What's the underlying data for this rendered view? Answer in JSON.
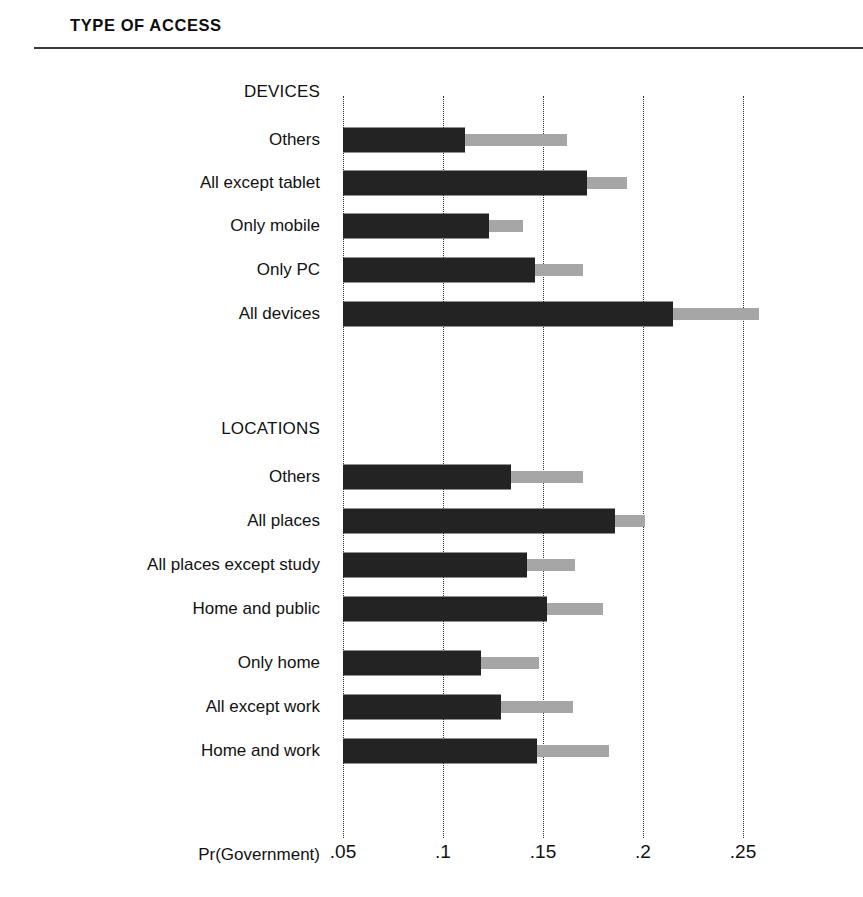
{
  "panel": {
    "title": "TYPE OF ACCESS"
  },
  "axis": {
    "title": "Pr(Government)",
    "ticks": [
      ".05",
      ".1",
      ".15",
      ".2",
      ".25"
    ],
    "tick_values": [
      0.05,
      0.1,
      0.15,
      0.2,
      0.25
    ]
  },
  "sections": [
    {
      "name": "devices-section",
      "label": "DEVICES"
    },
    {
      "name": "locations-section",
      "label": "LOCATIONS"
    }
  ],
  "colors": {
    "point_estimate": "#232323",
    "interval": "#a6a6a6",
    "gridline": "#2b2b2b",
    "rule": "#3a3a3a"
  },
  "chart_data": {
    "type": "bar",
    "title": "TYPE OF ACCESS",
    "xlabel": "Pr(Government)",
    "ylabel": "",
    "xlim": [
      0.05,
      0.27
    ],
    "grid": true,
    "orientation": "horizontal",
    "legend": [],
    "xticks": [
      0.05,
      0.1,
      0.15,
      0.2,
      0.25
    ],
    "xticklabels": [
      ".05",
      ".1",
      ".15",
      ".2",
      ".25"
    ],
    "groups": [
      {
        "label": "DEVICES",
        "categories": [
          "Others",
          "All except tablet",
          "Only mobile",
          "Only PC",
          "All devices"
        ],
        "values": [
          0.111,
          0.172,
          0.123,
          0.146,
          0.215
        ],
        "upper": [
          0.162,
          0.192,
          0.14,
          0.17,
          0.258
        ]
      },
      {
        "label": "LOCATIONS",
        "categories": [
          "Others",
          "All places",
          "All places except study",
          "Home and public",
          "Only home",
          "All except work",
          "Home and work"
        ],
        "values": [
          0.134,
          0.186,
          0.142,
          0.152,
          0.119,
          0.129,
          0.147
        ],
        "upper": [
          0.17,
          0.201,
          0.166,
          0.18,
          0.148,
          0.165,
          0.183
        ]
      }
    ],
    "series": [
      {
        "name": "point-estimate",
        "values": [
          0.111,
          0.172,
          0.123,
          0.146,
          0.215,
          0.134,
          0.186,
          0.142,
          0.152,
          0.119,
          0.129,
          0.147
        ]
      },
      {
        "name": "upper-bound",
        "values": [
          0.162,
          0.192,
          0.14,
          0.17,
          0.258,
          0.17,
          0.201,
          0.166,
          0.18,
          0.148,
          0.165,
          0.183
        ]
      }
    ]
  },
  "layout": {
    "x_origin_px": 343,
    "px_per_unit": 2000,
    "label_right_px": 320,
    "rows": [
      {
        "key": "devices-others",
        "y": 140,
        "group": 0,
        "index": 0
      },
      {
        "key": "devices-all-except-tablet",
        "y": 183,
        "group": 0,
        "index": 1
      },
      {
        "key": "devices-only-mobile",
        "y": 226,
        "group": 0,
        "index": 2
      },
      {
        "key": "devices-only-pc",
        "y": 270,
        "group": 0,
        "index": 3
      },
      {
        "key": "devices-all-devices",
        "y": 314,
        "group": 0,
        "index": 4
      },
      {
        "key": "locations-others",
        "y": 477,
        "group": 1,
        "index": 0
      },
      {
        "key": "locations-all-places",
        "y": 521,
        "group": 1,
        "index": 1
      },
      {
        "key": "locations-all-places-except-study",
        "y": 565,
        "group": 1,
        "index": 2
      },
      {
        "key": "locations-home-and-public",
        "y": 609,
        "group": 1,
        "index": 3
      },
      {
        "key": "locations-only-home",
        "y": 663,
        "group": 1,
        "index": 4
      },
      {
        "key": "locations-all-except-work",
        "y": 707,
        "group": 1,
        "index": 5
      },
      {
        "key": "locations-home-and-work",
        "y": 751,
        "group": 1,
        "index": 6
      }
    ],
    "section_heads": [
      {
        "key": "devices-head",
        "y": 82,
        "right": 320
      },
      {
        "key": "locations-head",
        "y": 419,
        "right": 320
      }
    ],
    "axis_label_y": 855,
    "tick_label_y": 841,
    "grid_top": 96,
    "grid_bottom": 838
  }
}
